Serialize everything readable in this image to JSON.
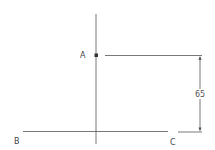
{
  "diagram": {
    "points": {
      "A": {
        "label": "A"
      },
      "B": {
        "label": "B"
      },
      "C": {
        "label": "C"
      }
    },
    "dimension": {
      "value": "65"
    },
    "colors": {
      "line": "#555555",
      "point": "#333333",
      "text": "#444444"
    }
  }
}
